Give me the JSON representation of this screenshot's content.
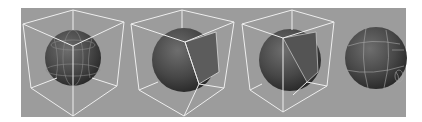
{
  "figure": {
    "background_color": "#9c9c9c",
    "wire_color": "#f2f2f2",
    "sphere_color": "#4a4a4a",
    "panels": [
      {
        "label": "sphere-in-cube-1",
        "variant": "latlong-sphere"
      },
      {
        "label": "sphere-in-cube-2",
        "variant": "projected-face"
      },
      {
        "label": "sphere-in-cube-3",
        "variant": "projected-face-smooth"
      },
      {
        "label": "sphere-result",
        "variant": "mapped-sphere"
      }
    ]
  }
}
